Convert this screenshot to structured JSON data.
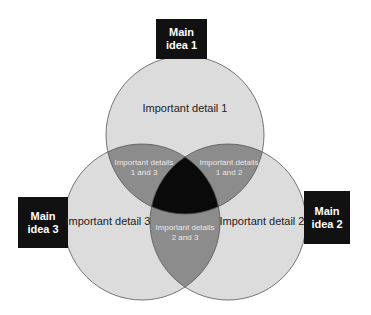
{
  "diagram": {
    "type": "venn-3",
    "main_ideas": [
      {
        "line1": "Main",
        "line2": "idea 1"
      },
      {
        "line1": "Main",
        "line2": "idea 2"
      },
      {
        "line1": "Main",
        "line2": "idea 3"
      }
    ],
    "details": {
      "d1": "Important detail 1",
      "d2": "Important detail 2",
      "d3": "Important detail 3"
    },
    "overlaps": {
      "o13": {
        "line1": "Important details",
        "line2": "1 and 3"
      },
      "o12": {
        "line1": "Important details",
        "line2": "1 and 2"
      },
      "o23": {
        "line1": "Important details",
        "line2": "2 and 3"
      }
    },
    "colors": {
      "circle_fill": "#dcdcdc",
      "pair_overlap": "#8c8c8c",
      "triple_overlap": "#0a0a0a",
      "box": "#111111",
      "stroke": "#555555"
    }
  }
}
